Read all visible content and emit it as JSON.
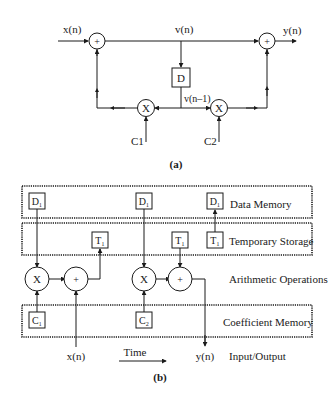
{
  "part_a": {
    "caption": "(a)",
    "labels": {
      "input": "x(n)",
      "output": "y(n)",
      "intermediate": "v(n)",
      "delayed": "v(n–1)",
      "delay_box": "D",
      "coef1": "C1",
      "coef2": "C2",
      "adder_symbol": "+",
      "multiplier_symbol": "X"
    }
  },
  "part_b": {
    "caption": "(b)",
    "rows": {
      "data_memory": "Data Memory",
      "temporary_storage": "Temporary Storage",
      "arithmetic_operations": "Arithmetic Operations",
      "coefficient_memory": "Coefficient Memory",
      "input_output": "Input/Output"
    },
    "boxes": {
      "d1_a": "D₁",
      "d1_b": "D₁",
      "d1_c": "D₁",
      "t1_a": "T₁",
      "t1_b": "T₁",
      "t1_c": "T₁",
      "c1": "C₁",
      "c2": "C₂"
    },
    "symbols": {
      "mult": "X",
      "add": "+"
    },
    "io": {
      "input": "x(n)",
      "output": "y(n)",
      "time": "Time"
    }
  }
}
